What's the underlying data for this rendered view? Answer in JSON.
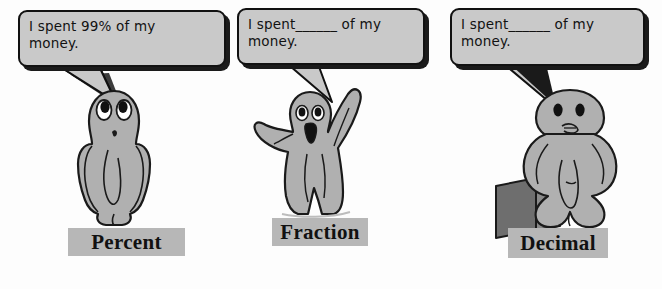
{
  "scene": {
    "title": "Percent Fraction Decimal cartoon worksheet",
    "background_color": "#fdfdfd",
    "figure_fill": "#b0b0b0",
    "figure_outline": "#1a1a1a",
    "bubble_fill": "#c9c9c9",
    "bubble_outline": "#111111",
    "plate_fill": "#b7b7b7"
  },
  "panels": [
    {
      "id": "percent",
      "bubble_text": "I spent 99% of my\nmoney.",
      "label": "Percent",
      "character": "standing-figure-arms-clasped"
    },
    {
      "id": "fraction",
      "bubble_text": "I spent______ of my\nmoney.",
      "label": "Fraction",
      "character": "standing-figure-arms-raised"
    },
    {
      "id": "decimal",
      "bubble_text": "I spent______ of my\nmoney.",
      "label": "Decimal",
      "character": "seated-figure-on-block"
    }
  ]
}
